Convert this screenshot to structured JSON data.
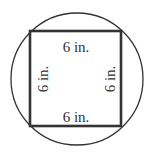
{
  "diagram": {
    "shape_outer": "circle",
    "shape_inner": "square",
    "labels": {
      "top": "6 in.",
      "bottom": "6 in.",
      "left": "6 in.",
      "right": "6 in."
    },
    "colors": {
      "stroke": "#333333",
      "background": "#ffffff"
    }
  }
}
